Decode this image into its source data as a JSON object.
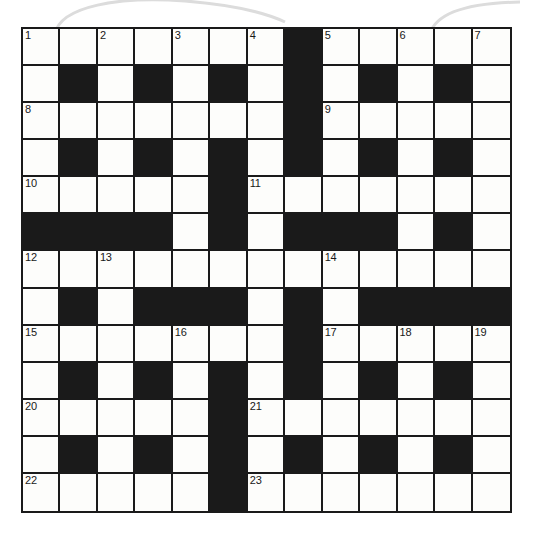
{
  "puzzle": {
    "title": "Crossword Grid",
    "type": "crossword",
    "rows": 13,
    "columns": 13,
    "colors": {
      "block": "#1a1a1a",
      "open": "#fdfdfb",
      "grid_line": "#1a1a1a",
      "clue_number": "#181818",
      "decor_arc": "#dcdcdc"
    },
    "legend": {
      "open_cell": "white square (letter entry)",
      "block_cell": "black square (blocked)"
    },
    "grid": [
      [
        "1",
        "",
        "2",
        "",
        "3",
        "",
        "4",
        "#",
        "5",
        "",
        "6",
        "",
        "7"
      ],
      [
        "",
        "#",
        "",
        "#",
        "",
        "#",
        "",
        "#",
        "",
        "#",
        "",
        "#",
        ""
      ],
      [
        "8",
        "",
        "",
        "",
        "",
        "",
        "",
        "#",
        "9",
        "",
        "",
        "",
        ""
      ],
      [
        "",
        "#",
        "",
        "#",
        "",
        "#",
        "",
        "#",
        "",
        "#",
        "",
        "#",
        ""
      ],
      [
        "10",
        "",
        "",
        "",
        "",
        "#",
        "11",
        "",
        "",
        "",
        "",
        "",
        ""
      ],
      [
        "#",
        "#",
        "#",
        "#",
        "",
        "#",
        "",
        "#",
        "#",
        "#",
        "",
        "#",
        ""
      ],
      [
        "12",
        "",
        "13",
        "",
        "",
        "",
        "",
        "",
        "14",
        "",
        "",
        "",
        ""
      ],
      [
        "",
        "#",
        "",
        "#",
        "#",
        "#",
        "",
        "#",
        "",
        "#",
        "#",
        "#",
        "#"
      ],
      [
        "15",
        "",
        "",
        "",
        "16",
        "",
        "",
        "#",
        "17",
        "",
        "18",
        "",
        "19"
      ],
      [
        "",
        "#",
        "",
        "#",
        "",
        "#",
        "",
        "#",
        "",
        "#",
        "",
        "#",
        ""
      ],
      [
        "20",
        "",
        "",
        "",
        "",
        "#",
        "21",
        "",
        "",
        "",
        "",
        "",
        ""
      ],
      [
        "",
        "#",
        "",
        "#",
        "",
        "#",
        "",
        "#",
        "",
        "#",
        "",
        "#",
        ""
      ],
      [
        "22",
        "",
        "",
        "",
        "",
        "#",
        "23",
        "",
        "",
        "",
        "",
        "",
        ""
      ]
    ],
    "clue_numbers": [
      {
        "n": "1",
        "row": 0,
        "col": 0
      },
      {
        "n": "2",
        "row": 0,
        "col": 2
      },
      {
        "n": "3",
        "row": 0,
        "col": 4
      },
      {
        "n": "4",
        "row": 0,
        "col": 6
      },
      {
        "n": "5",
        "row": 0,
        "col": 8
      },
      {
        "n": "6",
        "row": 0,
        "col": 10
      },
      {
        "n": "7",
        "row": 0,
        "col": 12
      },
      {
        "n": "8",
        "row": 2,
        "col": 0
      },
      {
        "n": "9",
        "row": 2,
        "col": 8
      },
      {
        "n": "10",
        "row": 4,
        "col": 0
      },
      {
        "n": "11",
        "row": 4,
        "col": 6
      },
      {
        "n": "12",
        "row": 6,
        "col": 0
      },
      {
        "n": "13",
        "row": 6,
        "col": 2
      },
      {
        "n": "14",
        "row": 6,
        "col": 8
      },
      {
        "n": "15",
        "row": 8,
        "col": 0
      },
      {
        "n": "16",
        "row": 8,
        "col": 4
      },
      {
        "n": "17",
        "row": 8,
        "col": 8
      },
      {
        "n": "18",
        "row": 8,
        "col": 10
      },
      {
        "n": "19",
        "row": 8,
        "col": 12
      },
      {
        "n": "20",
        "row": 10,
        "col": 0
      },
      {
        "n": "21",
        "row": 10,
        "col": 6
      },
      {
        "n": "22",
        "row": 12,
        "col": 0
      },
      {
        "n": "23",
        "row": 12,
        "col": 6
      }
    ]
  }
}
